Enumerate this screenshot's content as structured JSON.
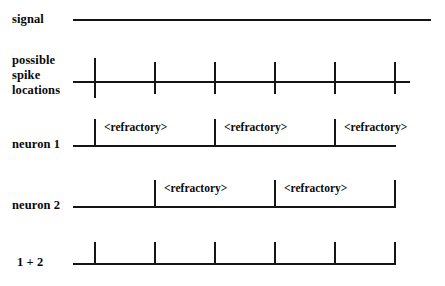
{
  "figure": {
    "background_color": "#ffffff",
    "line_color": "#151515"
  },
  "rows": [
    {
      "id": "signal",
      "label": "signal",
      "label_x": 12,
      "label_y": 12,
      "baseline_y": 20,
      "line_x1": 73,
      "line_x2": 431,
      "ticks": [],
      "refractory_spans": []
    },
    {
      "id": "possible-spike-locations",
      "label": "possible\nspike\nlocations",
      "label_x": 12,
      "label_y": 53,
      "baseline_y": 82,
      "line_x1": 73,
      "line_x2": 410,
      "ticks": [
        {
          "x": 95,
          "up": 24,
          "down": 16
        },
        {
          "x": 155,
          "up": 20,
          "down": 12
        },
        {
          "x": 215,
          "up": 20,
          "down": 12
        },
        {
          "x": 275,
          "up": 20,
          "down": 12
        },
        {
          "x": 335,
          "up": 20,
          "down": 12
        },
        {
          "x": 395,
          "up": 20,
          "down": 12
        }
      ],
      "refractory_spans": []
    },
    {
      "id": "neuron-1",
      "label": "neuron 1",
      "label_x": 12,
      "label_y": 137,
      "baseline_y": 146,
      "line_x1": 73,
      "line_x2": 396,
      "ticks": [
        {
          "x": 95,
          "up": 27,
          "down": 0
        },
        {
          "x": 215,
          "up": 27,
          "down": 0
        },
        {
          "x": 335,
          "up": 27,
          "down": 0
        }
      ],
      "refractory_spans": [
        {
          "text": "<refractory>",
          "x": 104,
          "y": 121
        },
        {
          "text": "<refractory>",
          "x": 224,
          "y": 121
        },
        {
          "text": "<refractory>",
          "x": 344,
          "y": 121
        }
      ]
    },
    {
      "id": "neuron-2",
      "label": "neuron 2",
      "label_x": 12,
      "label_y": 198,
      "baseline_y": 207,
      "line_x1": 73,
      "line_x2": 396,
      "ticks": [
        {
          "x": 155,
          "up": 27,
          "down": 0
        },
        {
          "x": 275,
          "up": 27,
          "down": 0
        },
        {
          "x": 395,
          "up": 27,
          "down": 0
        }
      ],
      "refractory_spans": [
        {
          "text": "<refractory>",
          "x": 164,
          "y": 182
        },
        {
          "text": "<refractory>",
          "x": 284,
          "y": 182
        }
      ]
    },
    {
      "id": "sum-1-plus-2",
      "label": "1 + 2",
      "label_x": 17,
      "label_y": 255,
      "baseline_y": 264,
      "line_x1": 73,
      "line_x2": 396,
      "ticks": [
        {
          "x": 95,
          "up": 22,
          "down": 0
        },
        {
          "x": 155,
          "up": 22,
          "down": 0
        },
        {
          "x": 215,
          "up": 22,
          "down": 0
        },
        {
          "x": 275,
          "up": 22,
          "down": 0
        },
        {
          "x": 335,
          "up": 22,
          "down": 0
        },
        {
          "x": 395,
          "up": 22,
          "down": 0
        }
      ],
      "refractory_spans": []
    }
  ]
}
